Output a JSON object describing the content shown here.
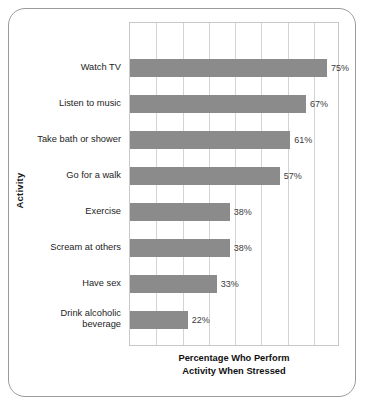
{
  "chart_data": {
    "type": "bar",
    "orientation": "horizontal",
    "title": "",
    "xlabel": "Percentage Who Perform Activity When Stressed",
    "xlabel_line1": "Percentage Who Perform",
    "xlabel_line2": "Activity When Stressed",
    "ylabel": "Activity",
    "categories": [
      "Watch TV",
      "Listen to music",
      "Take bath or shower",
      "Go for a walk",
      "Exercise",
      "Scream at others",
      "Have sex",
      "Drink alcoholic beverage"
    ],
    "values": [
      75,
      67,
      61,
      57,
      38,
      38,
      33,
      22
    ],
    "value_labels": [
      "75%",
      "67%",
      "61%",
      "57%",
      "38%",
      "38%",
      "33%",
      "22%"
    ],
    "xlim": [
      0,
      80
    ],
    "grid": true,
    "gridline_count": 8,
    "legend": "none",
    "bar_color": "#8b8b8b",
    "gridline_color": "#d3d3d3",
    "plot_border_color": "#c9c9c9",
    "frame_border_color": "#9b9b9b",
    "text_color": "#1d1d1d"
  },
  "category_label_lines": [
    [
      "Watch TV"
    ],
    [
      "Listen to music"
    ],
    [
      "Take bath or shower"
    ],
    [
      "Go for a walk"
    ],
    [
      "Exercise"
    ],
    [
      "Scream at others"
    ],
    [
      "Have sex"
    ],
    [
      "Drink alcoholic",
      "beverage"
    ]
  ]
}
